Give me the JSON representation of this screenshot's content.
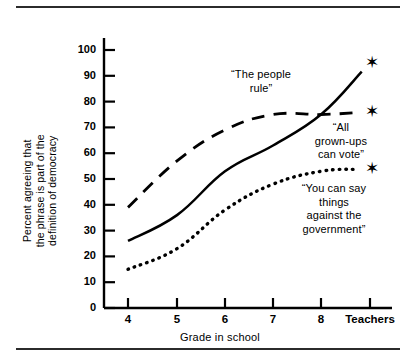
{
  "figure": {
    "has_top_rule": true,
    "has_bottom_rule": true,
    "background": "#ffffff",
    "ink": "#000000"
  },
  "chart_data": {
    "type": "line",
    "title": "",
    "subtitle": "",
    "xlabel": "Grade in school",
    "ylabel": "Percent agreeing that\nthe phrase is part of the\ndefinition of democracy",
    "categories": [
      "4",
      "5",
      "6",
      "7",
      "8",
      "Teachers"
    ],
    "x": [
      4,
      5,
      6,
      7,
      8,
      9
    ],
    "xlim": [
      3.6,
      9.4
    ],
    "ylim": [
      0,
      105
    ],
    "yticks": [
      0,
      10,
      20,
      30,
      40,
      50,
      60,
      70,
      80,
      90,
      100
    ],
    "grid": false,
    "legend_position": "inline-annotations",
    "marker": "star",
    "marker_note": "Each series ends with a star marker at the Teachers category",
    "series": [
      {
        "name": "“The people rule”",
        "style": "solid",
        "values": [
          26,
          36,
          53,
          63,
          75,
          95
        ]
      },
      {
        "name": "“All grown-ups can vote”",
        "style": "dashed",
        "values": [
          39,
          57,
          69,
          75,
          75,
          76
        ]
      },
      {
        "name": "“You can say things against the government”",
        "style": "dotted",
        "values": [
          15,
          23,
          38,
          48,
          53,
          54
        ]
      }
    ],
    "annotations": [
      {
        "text": "“The people\nrule”",
        "series": "“The people rule”"
      },
      {
        "text": "“All\ngrown-ups\ncan vote”",
        "series": "“All grown-ups can vote”"
      },
      {
        "text": "“You can say\nthings\nagainst the\ngovernment”",
        "series": "“You can say things against the government”"
      }
    ]
  }
}
